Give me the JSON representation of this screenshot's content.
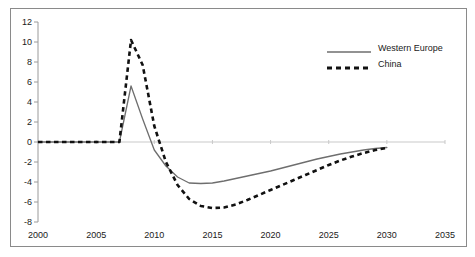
{
  "chart_data": {
    "type": "line",
    "title": "",
    "xlabel": "",
    "ylabel": "",
    "xlim": [
      2000,
      2035
    ],
    "ylim": [
      -8,
      12
    ],
    "xticks": [
      2000,
      2005,
      2010,
      2015,
      2020,
      2025,
      2030,
      2035
    ],
    "yticks": [
      -8,
      -6,
      -4,
      -2,
      0,
      2,
      4,
      6,
      8,
      10,
      12
    ],
    "grid": false,
    "zero_line": true,
    "legend_position": "top-right",
    "series": [
      {
        "name": "Western Europe",
        "style": "solid",
        "color": "#6e6e6e",
        "x": [
          2000,
          2001,
          2002,
          2003,
          2004,
          2005,
          2006,
          2007,
          2008,
          2009,
          2010,
          2011,
          2012,
          2013,
          2014,
          2015,
          2016,
          2017,
          2018,
          2019,
          2020,
          2021,
          2022,
          2023,
          2024,
          2025,
          2026,
          2027,
          2028,
          2029,
          2030
        ],
        "values": [
          0,
          0,
          0,
          0,
          0,
          0,
          0,
          0,
          5.6,
          2.3,
          -0.8,
          -2.4,
          -3.5,
          -4.1,
          -4.15,
          -4.1,
          -3.9,
          -3.65,
          -3.4,
          -3.15,
          -2.9,
          -2.6,
          -2.3,
          -2.0,
          -1.7,
          -1.45,
          -1.2,
          -1.0,
          -0.8,
          -0.65,
          -0.55
        ]
      },
      {
        "name": "China",
        "style": "dashed",
        "color": "#111111",
        "x": [
          2000,
          2001,
          2002,
          2003,
          2004,
          2005,
          2006,
          2007,
          2008,
          2009,
          2010,
          2011,
          2012,
          2013,
          2014,
          2015,
          2016,
          2017,
          2018,
          2019,
          2020,
          2021,
          2022,
          2023,
          2024,
          2025,
          2026,
          2027,
          2028,
          2029,
          2030
        ],
        "values": [
          0,
          0,
          0,
          0,
          0,
          0,
          0,
          0,
          10.2,
          7.7,
          1.6,
          -2.0,
          -4.3,
          -5.7,
          -6.4,
          -6.6,
          -6.55,
          -6.25,
          -5.8,
          -5.3,
          -4.8,
          -4.3,
          -3.8,
          -3.3,
          -2.8,
          -2.3,
          -1.85,
          -1.45,
          -1.1,
          -0.8,
          -0.6
        ]
      }
    ]
  },
  "legend": {
    "items": [
      {
        "label": "Western Europe"
      },
      {
        "label": "China"
      }
    ]
  },
  "axes": {
    "y_tick_labels": [
      "12",
      "10",
      "8",
      "6",
      "4",
      "2",
      "0",
      "-2",
      "-4",
      "-6",
      "-8"
    ],
    "x_tick_labels": [
      "2000",
      "2005",
      "2010",
      "2015",
      "2020",
      "2025",
      "2030",
      "2035"
    ]
  },
  "colors": {
    "western_europe": "#6e6e6e",
    "china": "#111111",
    "axis": "#9a9a9a",
    "frame": "#8a8a8a",
    "text": "#1a1a1a"
  }
}
